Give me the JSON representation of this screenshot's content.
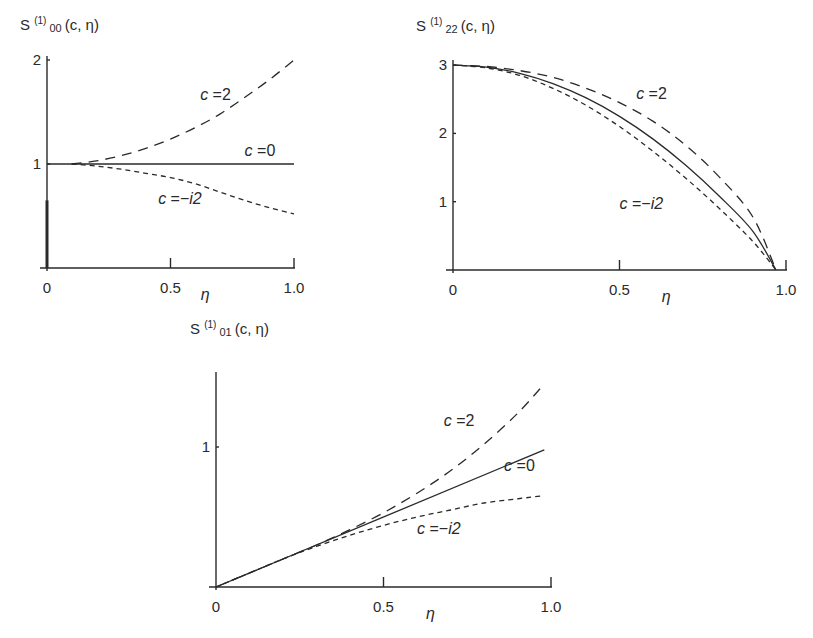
{
  "chart_data": [
    {
      "type": "line",
      "id": "s00",
      "title": {
        "base": "S",
        "sup": "(1)",
        "sub": "00",
        "args": "(c, η)"
      },
      "xlabel": "η",
      "ylabel": "S(1)00(c, η)",
      "xlim": [
        0,
        1.0
      ],
      "ylim": [
        0,
        2
      ],
      "xticks": [
        0,
        0.5,
        1.0
      ],
      "xtick_labels": [
        "0",
        "0.5",
        "1.0"
      ],
      "yticks": [
        1,
        2
      ],
      "ytick_labels": [
        "1",
        "2"
      ],
      "grid": false,
      "series": [
        {
          "name": "c = 2",
          "label_parts": [
            "c",
            " =2"
          ],
          "style": "long-dash",
          "x": [
            0.1,
            0.2,
            0.3,
            0.4,
            0.5,
            0.6,
            0.7,
            0.8,
            0.9,
            1.0
          ],
          "y": [
            1.0,
            1.03,
            1.08,
            1.15,
            1.24,
            1.35,
            1.48,
            1.64,
            1.81,
            2.0
          ]
        },
        {
          "name": "c = 0",
          "label_parts": [
            "c",
            " =0"
          ],
          "style": "solid",
          "x": [
            0.0,
            1.0
          ],
          "y": [
            1.0,
            1.0
          ]
        },
        {
          "name": "c = -i2",
          "label_parts": [
            "c",
            " =−",
            "i",
            "2"
          ],
          "style": "short-dash",
          "x": [
            0.1,
            0.2,
            0.3,
            0.4,
            0.5,
            0.6,
            0.7,
            0.8,
            0.9,
            1.0
          ],
          "y": [
            1.0,
            0.98,
            0.95,
            0.91,
            0.87,
            0.81,
            0.73,
            0.65,
            0.58,
            0.52
          ]
        }
      ],
      "annotations": [
        {
          "text": "c = 2",
          "series": 0,
          "at": [
            0.62,
            1.62
          ]
        },
        {
          "text": "c = 0",
          "series": 1,
          "at": [
            0.8,
            1.08
          ]
        },
        {
          "text": "c = -i2",
          "series": 2,
          "at": [
            0.45,
            0.62
          ]
        }
      ]
    },
    {
      "type": "line",
      "id": "s22",
      "title": {
        "base": "S",
        "sup": "(1)",
        "sub": "22",
        "args": "(c, η)"
      },
      "xlabel": "η",
      "ylabel": "S(1)22(c, η)",
      "xlim": [
        0,
        1.0
      ],
      "ylim": [
        0,
        3
      ],
      "xticks": [
        0,
        0.5,
        1.0
      ],
      "xtick_labels": [
        "0",
        "0.5",
        "1.0"
      ],
      "yticks": [
        1,
        2,
        3
      ],
      "ytick_labels": [
        "1",
        "2",
        "3"
      ],
      "grid": false,
      "series": [
        {
          "name": "c = 2",
          "label_parts": [
            "c",
            " =2"
          ],
          "style": "long-dash",
          "x": [
            0.0,
            0.1,
            0.2,
            0.3,
            0.4,
            0.5,
            0.6,
            0.7,
            0.8,
            0.9,
            0.97
          ],
          "y": [
            3.0,
            2.98,
            2.92,
            2.82,
            2.66,
            2.45,
            2.18,
            1.82,
            1.36,
            0.78,
            0.0
          ]
        },
        {
          "name": "c = 0",
          "label_parts": [
            "c",
            " =0"
          ],
          "style": "solid",
          "x": [
            0.0,
            0.1,
            0.2,
            0.3,
            0.4,
            0.5,
            0.6,
            0.7,
            0.8,
            0.9,
            0.97
          ],
          "y": [
            3.0,
            2.97,
            2.88,
            2.73,
            2.52,
            2.25,
            1.92,
            1.53,
            1.08,
            0.57,
            0.0
          ]
        },
        {
          "name": "c = -i2",
          "label_parts": [
            "c",
            " =−",
            "i",
            "2"
          ],
          "style": "short-dash",
          "x": [
            0.0,
            0.1,
            0.2,
            0.3,
            0.4,
            0.5,
            0.6,
            0.7,
            0.8,
            0.9,
            0.97
          ],
          "y": [
            3.0,
            2.96,
            2.85,
            2.66,
            2.41,
            2.1,
            1.74,
            1.34,
            0.9,
            0.42,
            0.0
          ]
        }
      ],
      "annotations": [
        {
          "text": "c = 2",
          "series": 0,
          "at": [
            0.55,
            2.5
          ]
        },
        {
          "text": "c = -i2",
          "series": 2,
          "at": [
            0.5,
            0.9
          ]
        }
      ]
    },
    {
      "type": "line",
      "id": "s01",
      "title": {
        "base": "S",
        "sup": "(1)",
        "sub": "01",
        "args": "(c, η)"
      },
      "xlabel": "η",
      "ylabel": "S(1)01(c, η)",
      "xlim": [
        0,
        1.0
      ],
      "ylim": [
        0,
        1.5
      ],
      "xticks": [
        0,
        0.5,
        1.0
      ],
      "xtick_labels": [
        "0",
        "0.5",
        "1.0"
      ],
      "yticks": [
        1
      ],
      "ytick_labels": [
        "1"
      ],
      "grid": false,
      "series": [
        {
          "name": "c = 2",
          "label_parts": [
            "c",
            " =2"
          ],
          "style": "long-dash",
          "x": [
            0.0,
            0.1,
            0.2,
            0.3,
            0.4,
            0.5,
            0.6,
            0.7,
            0.8,
            0.9,
            0.98
          ],
          "y": [
            0.0,
            0.1,
            0.2,
            0.3,
            0.41,
            0.53,
            0.67,
            0.83,
            1.02,
            1.24,
            1.45
          ]
        },
        {
          "name": "c = 0",
          "label_parts": [
            "c",
            " =0"
          ],
          "style": "solid",
          "x": [
            0.0,
            0.98
          ],
          "y": [
            0.0,
            0.98
          ]
        },
        {
          "name": "c = -i2",
          "label_parts": [
            "c",
            " =−",
            "i",
            "2"
          ],
          "style": "short-dash",
          "x": [
            0.0,
            0.1,
            0.2,
            0.3,
            0.4,
            0.5,
            0.6,
            0.7,
            0.8,
            0.9,
            0.97
          ],
          "y": [
            0.0,
            0.1,
            0.2,
            0.29,
            0.37,
            0.44,
            0.5,
            0.55,
            0.6,
            0.63,
            0.65
          ]
        }
      ],
      "annotations": [
        {
          "text": "c = 2",
          "series": 0,
          "at": [
            0.68,
            1.15
          ]
        },
        {
          "text": "c = 0",
          "series": 1,
          "at": [
            0.86,
            0.83
          ]
        },
        {
          "text": "c = -i2",
          "series": 2,
          "at": [
            0.6,
            0.38
          ]
        }
      ]
    }
  ]
}
